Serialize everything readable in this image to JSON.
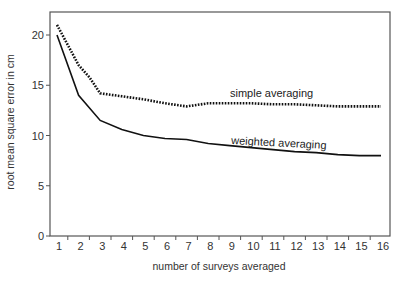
{
  "chart_data": {
    "type": "line",
    "title": "",
    "xlabel": "number of surveys averaged",
    "ylabel": "root mean square error in cm",
    "xlim": [
      1,
      16
    ],
    "ylim": [
      0,
      22
    ],
    "x_ticks": [
      1,
      2,
      3,
      4,
      5,
      6,
      7,
      8,
      9,
      10,
      11,
      12,
      13,
      14,
      15,
      16
    ],
    "y_ticks": [
      0,
      5,
      10,
      15,
      20
    ],
    "grid": false,
    "legend": "inline labels",
    "series": [
      {
        "name": "simple averaging",
        "style": "dotted",
        "color": "#111111",
        "x": [
          1,
          1.5,
          2,
          2.5,
          3,
          4,
          5,
          6,
          7,
          8,
          9,
          10,
          11,
          12,
          13,
          14,
          15,
          16
        ],
        "values": [
          21.0,
          19.0,
          17.0,
          15.8,
          14.2,
          13.9,
          13.6,
          13.2,
          12.9,
          13.2,
          13.2,
          13.2,
          13.1,
          13.1,
          13.0,
          12.9,
          12.9,
          12.9
        ]
      },
      {
        "name": "weighted averaging",
        "style": "solid",
        "color": "#111111",
        "x": [
          1,
          2,
          3,
          4,
          5,
          6,
          7,
          8,
          9,
          10,
          11,
          12,
          13,
          14,
          15,
          16
        ],
        "values": [
          20.0,
          14.0,
          11.5,
          10.6,
          10.0,
          9.7,
          9.6,
          9.2,
          9.0,
          8.8,
          8.6,
          8.4,
          8.3,
          8.1,
          8.0,
          8.0
        ]
      }
    ]
  },
  "labels": {
    "simple": "simple averaging",
    "weighted": "weighted averaging",
    "xlabel": "number of surveys averaged",
    "ylabel": "root mean square error in cm"
  },
  "colors": {
    "axis": "#555555",
    "line": "#111111",
    "text": "#333333"
  }
}
